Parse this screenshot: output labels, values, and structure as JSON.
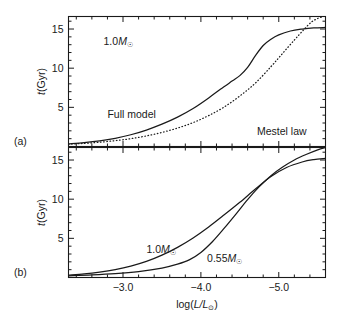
{
  "figure": {
    "caption_tags": {
      "panel_a": "(a)",
      "panel_b": "(b)"
    },
    "xaxis": {
      "label_prefix": "log(",
      "label_var": "L/L",
      "label_sub": "⊙",
      "label_suffix": ")",
      "ticklabels": [
        "−3.0",
        "−4.0",
        "−5.0"
      ],
      "tickvalues": [
        -3.0,
        -4.0,
        -5.0
      ],
      "range": [
        -2.3,
        -5.6
      ],
      "minor_step": 0.2,
      "direction": "decreasing"
    },
    "yaxis": {
      "label_var": "t",
      "label_units": "(Gyr)",
      "ticklabels": [
        "5",
        "10",
        "15"
      ],
      "tickvalues": [
        5,
        10,
        15
      ],
      "range": [
        0,
        16.6
      ],
      "minor_step": 1
    }
  },
  "chart_data": [
    {
      "type": "line",
      "panel": "(a)",
      "title": "",
      "xlabel": "log(L/L☉)",
      "ylabel": "t(Gyr)",
      "xlim": [
        -2.3,
        -5.6
      ],
      "ylim": [
        0,
        16.6
      ],
      "grid": false,
      "legend": "in-plot annotations",
      "annotations": [
        {
          "text": "1.0M☉",
          "x": -2.75,
          "y": 12.9
        },
        {
          "text": "Full model",
          "x": -2.8,
          "y": 3.7
        },
        {
          "text": "Mestel law",
          "x": -4.72,
          "y": 1.5
        }
      ],
      "series": [
        {
          "name": "Full model",
          "style": "solid",
          "x": [
            -2.3,
            -2.5,
            -2.7,
            -2.9,
            -3.1,
            -3.3,
            -3.5,
            -3.7,
            -3.9,
            -4.1,
            -4.25,
            -4.4,
            -4.5,
            -4.6,
            -4.7,
            -4.8,
            -4.9,
            -5.0,
            -5.15,
            -5.3,
            -5.45,
            -5.6
          ],
          "y": [
            0.35,
            0.5,
            0.72,
            1.05,
            1.5,
            2.1,
            2.85,
            3.75,
            4.85,
            6.2,
            7.3,
            8.35,
            9.05,
            10.1,
            11.6,
            12.9,
            13.7,
            14.25,
            14.75,
            15.0,
            15.15,
            15.2
          ]
        },
        {
          "name": "Mestel law",
          "style": "dotted",
          "x": [
            -2.3,
            -2.5,
            -2.7,
            -2.9,
            -3.1,
            -3.3,
            -3.5,
            -3.7,
            -3.9,
            -4.1,
            -4.3,
            -4.5,
            -4.7,
            -4.9,
            -5.05,
            -5.2,
            -5.32,
            -5.42,
            -5.5,
            -5.56
          ],
          "y": [
            0.3,
            0.4,
            0.55,
            0.75,
            1.0,
            1.35,
            1.8,
            2.35,
            3.05,
            3.95,
            5.05,
            6.45,
            8.1,
            10.2,
            11.9,
            13.6,
            14.9,
            15.9,
            16.35,
            16.55
          ]
        }
      ]
    },
    {
      "type": "line",
      "panel": "(b)",
      "title": "",
      "xlabel": "log(L/L☉)",
      "ylabel": "t(Gyr)",
      "xlim": [
        -2.3,
        -5.6
      ],
      "ylim": [
        0,
        16.6
      ],
      "grid": false,
      "legend": "in-plot annotations",
      "annotations": [
        {
          "text": "1.0M☉",
          "x": -3.3,
          "y": 3.1
        },
        {
          "text": "0.55M☉",
          "x": -4.08,
          "y": 2.0
        }
      ],
      "series": [
        {
          "name": "1.0M☉",
          "style": "solid",
          "x": [
            -2.3,
            -2.5,
            -2.7,
            -2.9,
            -3.1,
            -3.3,
            -3.5,
            -3.7,
            -3.9,
            -4.1,
            -4.3,
            -4.5,
            -4.7,
            -4.9,
            -5.1,
            -5.3,
            -5.45,
            -5.6
          ],
          "y": [
            0.3,
            0.45,
            0.68,
            1.0,
            1.45,
            2.05,
            2.85,
            3.85,
            5.05,
            6.45,
            8.0,
            9.6,
            11.3,
            12.9,
            14.05,
            14.75,
            15.05,
            15.2
          ]
        },
        {
          "name": "0.55M☉",
          "style": "solid",
          "x": [
            -2.3,
            -2.6,
            -2.9,
            -3.2,
            -3.5,
            -3.7,
            -3.85,
            -4.0,
            -4.15,
            -4.3,
            -4.45,
            -4.6,
            -4.75,
            -4.9,
            -5.05,
            -5.2,
            -5.35,
            -5.5,
            -5.6
          ],
          "y": [
            0.22,
            0.32,
            0.48,
            0.75,
            1.2,
            1.7,
            2.25,
            3.2,
            4.6,
            6.3,
            8.1,
            9.95,
            11.6,
            13.0,
            14.1,
            15.0,
            15.7,
            16.3,
            16.6
          ]
        }
      ]
    }
  ]
}
